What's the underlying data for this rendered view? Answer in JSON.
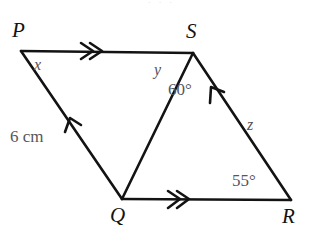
{
  "figure": {
    "type": "geometry-diagram",
    "stroke_color": "#131313",
    "label_color": "#131313",
    "annotation_color": "#56565c",
    "background": "#ffffff",
    "width": 312,
    "height": 241
  },
  "vertices": [
    {
      "id": "P",
      "label": "P",
      "x": 21,
      "y": 51
    },
    {
      "id": "S",
      "label": "S",
      "x": 193,
      "y": 53
    },
    {
      "id": "Q",
      "label": "Q",
      "x": 122,
      "y": 199
    },
    {
      "id": "R",
      "label": "R",
      "x": 291,
      "y": 200
    }
  ],
  "vertex_labels": [
    {
      "text": "P",
      "left": 12,
      "top": 20
    },
    {
      "text": "S",
      "left": 186,
      "top": 21
    },
    {
      "text": "Q",
      "left": 110,
      "top": 205
    },
    {
      "text": "R",
      "left": 282,
      "top": 206
    }
  ],
  "segments": [
    {
      "from": "P",
      "to": "S",
      "name": "segment-ps"
    },
    {
      "from": "P",
      "to": "Q",
      "name": "segment-pq"
    },
    {
      "from": "S",
      "to": "Q",
      "name": "segment-sq"
    },
    {
      "from": "S",
      "to": "R",
      "name": "segment-sr"
    },
    {
      "from": "Q",
      "to": "R",
      "name": "segment-qr"
    }
  ],
  "tick_marks": [
    {
      "on": "segment-ps",
      "style": "double-chevron",
      "direction": "toward-S"
    },
    {
      "on": "segment-qr",
      "style": "double-chevron",
      "direction": "toward-R"
    },
    {
      "on": "segment-pq",
      "style": "single-chevron",
      "direction": "toward-P"
    },
    {
      "on": "segment-sr",
      "style": "single-chevron",
      "direction": "toward-S"
    }
  ],
  "annotations": {
    "angle_x": {
      "text": "x",
      "left": 34,
      "top": 57
    },
    "angle_y": {
      "text": "y",
      "left": 154,
      "top": 62
    },
    "angle_60": {
      "text": "60°",
      "left": 168,
      "top": 81
    },
    "angle_55": {
      "text": "55°",
      "left": 232,
      "top": 172
    },
    "side_z": {
      "text": "z",
      "left": 247,
      "top": 117
    },
    "side_6cm": {
      "text": "6 cm",
      "left": 10,
      "top": 128
    }
  },
  "top_artifact": {
    "text": "· · ·"
  }
}
